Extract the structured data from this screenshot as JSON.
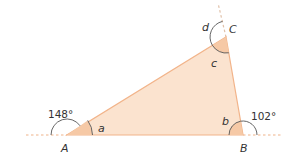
{
  "diagram": {
    "type": "triangle-exterior-angles",
    "vertices": {
      "A": {
        "label": "A"
      },
      "B": {
        "label": "B"
      },
      "C": {
        "label": "C"
      }
    },
    "interior_angles": {
      "a": {
        "label": "a",
        "vertex": "A"
      },
      "b": {
        "label": "b",
        "vertex": "B"
      },
      "c": {
        "label": "c",
        "vertex": "C"
      }
    },
    "exterior_angles": {
      "A": {
        "label": "148°",
        "value_deg": 148
      },
      "B": {
        "label": "102°",
        "value_deg": 102
      },
      "C": {
        "label": "d"
      }
    },
    "colors": {
      "fill": "#fbe3cf",
      "fill_dark": "#f6c9a6",
      "edge": "#f2b48a",
      "arc": "#555555",
      "dashed": "#f0b38a",
      "text": "#333333"
    }
  }
}
